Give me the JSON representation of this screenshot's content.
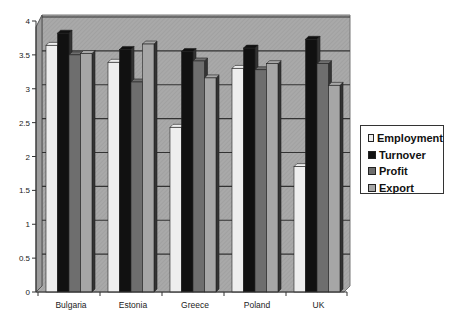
{
  "chart_data": {
    "type": "bar",
    "style": "3d-clustered-column",
    "title": "",
    "xlabel": "",
    "ylabel": "",
    "ylim": [
      0,
      4
    ],
    "yticks": [
      "0",
      "0.5",
      "1",
      "1.5",
      "2",
      "2.5",
      "3",
      "3.5",
      "4"
    ],
    "grid": true,
    "legend_position": "right",
    "categories": [
      "Bulgaria",
      "Estonia",
      "Greece",
      "Poland",
      "UK"
    ],
    "series": [
      {
        "name": "Employment",
        "color": "#eeeeee",
        "values": [
          3.64,
          3.39,
          2.43,
          3.3,
          1.85
        ]
      },
      {
        "name": "Turnover",
        "color": "#111111",
        "values": [
          3.82,
          3.58,
          3.55,
          3.6,
          3.73
        ]
      },
      {
        "name": "Profit",
        "color": "#6e6e6e",
        "values": [
          3.5,
          3.1,
          3.41,
          3.28,
          3.37
        ]
      },
      {
        "name": "Export",
        "color": "#a6a6a6",
        "values": [
          3.52,
          3.66,
          3.16,
          3.37,
          3.05
        ]
      }
    ]
  },
  "legend": {
    "items": [
      {
        "label": "Employment"
      },
      {
        "label": "Turnover"
      },
      {
        "label": "Profit"
      },
      {
        "label": "Export"
      }
    ]
  }
}
